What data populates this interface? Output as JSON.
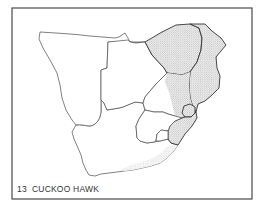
{
  "figure": {
    "number": "13",
    "title": "CUCKOO HAWK",
    "caption": "13  CUCKOO HAWK"
  },
  "map": {
    "subject": "Distribution map of southern Africa",
    "legend_note": "Stippled areas indicate species range",
    "colors": {
      "outline": "#4a4a4a",
      "stipple": "#8a8a8a",
      "background": "#ffffff"
    },
    "regions": [
      {
        "id": "namibia",
        "shaded": false
      },
      {
        "id": "botswana",
        "shaded": false
      },
      {
        "id": "zimbabwe",
        "shaded": true
      },
      {
        "id": "mozambique",
        "shaded": true
      },
      {
        "id": "transvaal",
        "shaded": "partial"
      },
      {
        "id": "swaziland",
        "shaded": true
      },
      {
        "id": "natal",
        "shaded": true
      },
      {
        "id": "lesotho",
        "shaded": false
      },
      {
        "id": "orange-free-state",
        "shaded": false
      },
      {
        "id": "cape-province",
        "shaded": "partial"
      }
    ]
  }
}
